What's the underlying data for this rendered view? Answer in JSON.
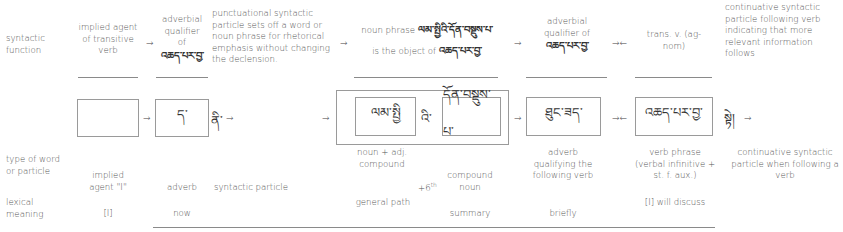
{
  "row_labels": {
    "syntactic_function": "syntactic function",
    "type_of_word": "type of word or particle",
    "lexical_meaning": "lexical meaning"
  },
  "syntactic_function": {
    "col1": "implied agent of transitive verb",
    "col2_line1": "adverbial qualifier of",
    "col2_tib": "འཆད་པར་བྱ་",
    "col3": "punctuational syntactic particle sets off a word or noun phrase for rhetorical emphasis without changing the declension.",
    "col4_line1_prefix": "noun phrase",
    "col4_line1_tib": "ལམ་སྤྱིའི་དོན་བསྡུས་པ་",
    "col4_line2_prefix": "is the object of",
    "col4_line2_tib": "འཆད་པར་བྱ་",
    "col5_line1": "adverbial qualifier of",
    "col5_tib": "འཆད་པར་བྱ་",
    "col6": "trans. v. (ag-nom)",
    "col7": "continuative syntactic particle following verb indicating that more relevant information follows"
  },
  "tibetan_row": {
    "box1": "",
    "box2": "ད་",
    "particle1": "ནི་",
    "inner_box1": "ལམ་སྤྱི",
    "genitive": "འི་",
    "inner_box2": "དོན་བསྡུས་པ་",
    "box_adverb": "ཐུང་ཟད་",
    "box_verb": "འཆད་པར་བྱ་",
    "particle2": "སྟེ།"
  },
  "arrows": {
    "right": "→",
    "left": "←"
  },
  "type_of_word": {
    "col1": "implied agent \"I\"",
    "col2": "adverb",
    "col3": "syntactic particle",
    "col4a": "noun + adj. compound",
    "col4_gen": "+6",
    "col4_gen_sup": "th",
    "col4b": "compound noun",
    "col5": "adverb qualifying the following verb",
    "col6": "verb phrase (verbal infinitive + st. f. aux.)",
    "col7": "continuative syntactic particle when following a verb"
  },
  "lexical_meaning": {
    "col1": "[I]",
    "col2": "now",
    "col4a": "general path",
    "col4b": "summary",
    "col5": "briefly",
    "col6": "[I] will discuss"
  }
}
